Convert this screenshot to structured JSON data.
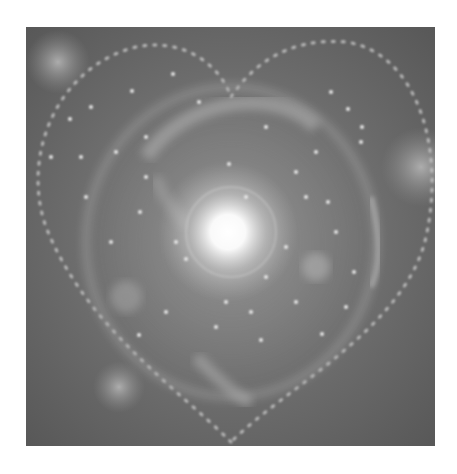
{
  "image": {
    "subject": "heart-shaped cosmic galaxy with bright central glow",
    "style": "grayscale",
    "colors": {
      "background_outer": "#ffffff",
      "space": "#5f5f5f",
      "nebula": "#9a9a9a",
      "core": "#ffffff",
      "stars": "#e6e6e6"
    }
  }
}
